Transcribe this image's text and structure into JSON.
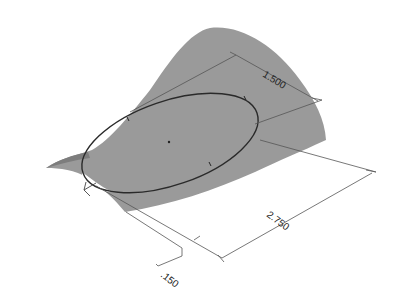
{
  "drawing": {
    "type": "isometric CAD view",
    "subject": "lofted surface with sketched ellipse",
    "colors": {
      "background": "#ffffff",
      "surface_fill": "#9a9a9a",
      "surface_shade": "#8a8a8a",
      "ellipse_stroke": "#2a2a2a",
      "dimension_line": "#555555",
      "dimension_text": "#222222"
    },
    "dimensions": [
      {
        "id": "width",
        "label": "1.500"
      },
      {
        "id": "length",
        "label": "2.750"
      },
      {
        "id": "offset",
        "label": ".150"
      }
    ]
  }
}
